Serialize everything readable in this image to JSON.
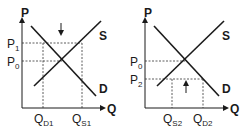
{
  "left_chart": {
    "y_axis_label": "P",
    "x_axis_label": "Q",
    "supply_label": "S",
    "demand_label": "D",
    "price_high": {
      "main": "P",
      "sub": "1"
    },
    "price_eq": {
      "main": "P",
      "sub": "0"
    },
    "qty_demanded": {
      "main": "Q",
      "sub": "D1"
    },
    "qty_supplied": {
      "main": "Q",
      "sub": "S1"
    },
    "arrow_direction": "down"
  },
  "right_chart": {
    "y_axis_label": "P",
    "x_axis_label": "Q",
    "supply_label": "S",
    "demand_label": "D",
    "price_eq": {
      "main": "P",
      "sub": "0"
    },
    "price_low": {
      "main": "P",
      "sub": "2"
    },
    "qty_supplied": {
      "main": "Q",
      "sub": "S2"
    },
    "qty_demanded": {
      "main": "Q",
      "sub": "D2"
    },
    "arrow_direction": "up"
  },
  "colors": {
    "line": "#1a1a1a",
    "dashed": "#333333",
    "background": "#ffffff"
  }
}
